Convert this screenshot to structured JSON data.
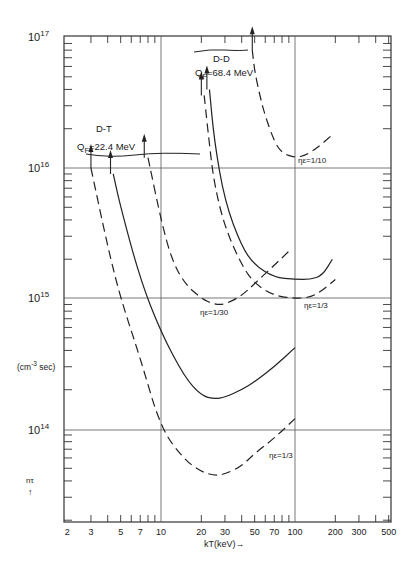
{
  "chart_data": {
    "type": "line",
    "title": "",
    "xlabel": "kT(keV)→",
    "ylabel_units": "(cm-3 sec)",
    "ylabel": "nτ ↑",
    "x_scale": "log",
    "y_scale": "log",
    "xlim": [
      2,
      550
    ],
    "ylim": [
      20000000000000.0,
      1e+17
    ],
    "grid": true,
    "x_ticks": [
      "2",
      "3",
      "5",
      "7",
      "10",
      "20",
      "30",
      "50",
      "70",
      "100",
      "200",
      "300",
      "500"
    ],
    "y_ticks": [
      {
        "base": "10",
        "exp": "17"
      },
      {
        "base": "10",
        "exp": "16"
      },
      {
        "base": "10",
        "exp": "15"
      },
      {
        "base": "10",
        "exp": "14"
      }
    ],
    "group_labels": [
      {
        "name": "D-T",
        "q": "Q",
        "sub": "F",
        "value": "=22.4 MeV"
      },
      {
        "name": "D-D",
        "q": "Q",
        "sub": "F",
        "value": "=68.4 MeV"
      }
    ],
    "annotations": [
      {
        "text": "ηε=1/10"
      },
      {
        "text": "ηε=1/30"
      },
      {
        "text": "ηε=1/3"
      },
      {
        "text": "ηε=1/3"
      }
    ],
    "series": [
      {
        "name": "D-T ηε=1/3",
        "style": "dashed",
        "ignition_arrow_kT": 3,
        "x": [
          3,
          4,
          5,
          7,
          10,
          15,
          20,
          25,
          30,
          40,
          50,
          70,
          100
        ],
        "y": [
          1e+16,
          2500000000000000.0,
          1000000000000000.0,
          350000000000000.0,
          100000000000000.0,
          58000000000000.0,
          47000000000000.0,
          44000000000000.0,
          45000000000000.0,
          52000000000000.0,
          65000000000000.0,
          85000000000000.0,
          120000000000000.0
        ]
      },
      {
        "name": "D-T ηε=1/10",
        "style": "solid",
        "ignition_arrow_kT": 4.2,
        "x": [
          4.4,
          5,
          7,
          10,
          15,
          20,
          25,
          30,
          40,
          50,
          70,
          100
        ],
        "y": [
          9000000000000000.0,
          5000000000000000.0,
          1400000000000000.0,
          550000000000000.0,
          250000000000000.0,
          180000000000000.0,
          170000000000000.0,
          175000000000000.0,
          200000000000000.0,
          230000000000000.0,
          300000000000000.0,
          420000000000000.0
        ]
      },
      {
        "name": "D-T ηε=1/30",
        "style": "dashed",
        "ignition_arrow_kT": 7.5,
        "x": [
          8,
          10,
          12,
          15,
          20,
          25,
          30,
          40,
          50,
          70,
          90
        ],
        "y": [
          1.2e+16,
          4000000000000000.0,
          2000000000000000.0,
          1300000000000000.0,
          1000000000000000.0,
          900000000000000.0,
          900000000000000.0,
          1050000000000000.0,
          1300000000000000.0,
          1800000000000000.0,
          2300000000000000.0
        ]
      },
      {
        "name": "D-D ηε=1/3",
        "style": "dashed",
        "ignition_arrow_kT": 20,
        "x": [
          21,
          23,
          25,
          30,
          40,
          50,
          70,
          100,
          130,
          160,
          200
        ],
        "y": [
          3.6e+16,
          1.5e+16,
          7500000000000000.0,
          3500000000000000.0,
          1800000000000000.0,
          1300000000000000.0,
          1050000000000000.0,
          1000000000000000.0,
          1020000000000000.0,
          1150000000000000.0,
          1400000000000000.0
        ]
      },
      {
        "name": "D-D ηε=1/10 (solid)",
        "style": "solid",
        "ignition_arrow_kT": 22,
        "x": [
          23,
          25,
          30,
          40,
          50,
          70,
          100,
          130,
          160,
          190
        ],
        "y": [
          4e+16,
          1.6e+16,
          5500000000000000.0,
          2500000000000000.0,
          1800000000000000.0,
          1450000000000000.0,
          1400000000000000.0,
          1400000000000000.0,
          1500000000000000.0,
          2000000000000000.0
        ]
      },
      {
        "name": "D-D ηε=1/10",
        "style": "dashed",
        "ignition_arrow_kT": 48,
        "x": [
          48,
          50,
          55,
          60,
          70,
          80,
          100,
          120,
          150,
          190
        ],
        "y": [
          8e+16,
          5.5e+16,
          3.5e+16,
          2.5e+16,
          1.6e+16,
          1.3e+16,
          1.2e+16,
          1.25e+16,
          1.45e+16,
          1.8e+16
        ]
      }
    ]
  }
}
